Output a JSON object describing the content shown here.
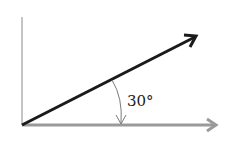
{
  "diagram": {
    "type": "vector-angle",
    "angle_label": "30°",
    "angle_degrees": 30,
    "colors": {
      "vector": "#1a1a1a",
      "reference_axis": "#9a9a9a",
      "vertical_axis": "#8a8a8a",
      "arc": "#7a7a7a",
      "text": "#222222"
    }
  }
}
